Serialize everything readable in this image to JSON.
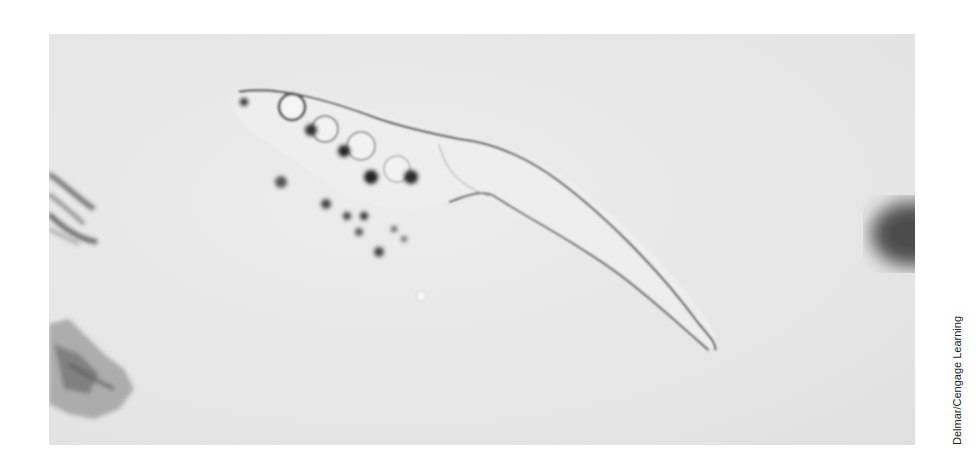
{
  "figure": {
    "background_color": "#e6e6e6",
    "credit": "Delmar/Cengage Learning"
  }
}
